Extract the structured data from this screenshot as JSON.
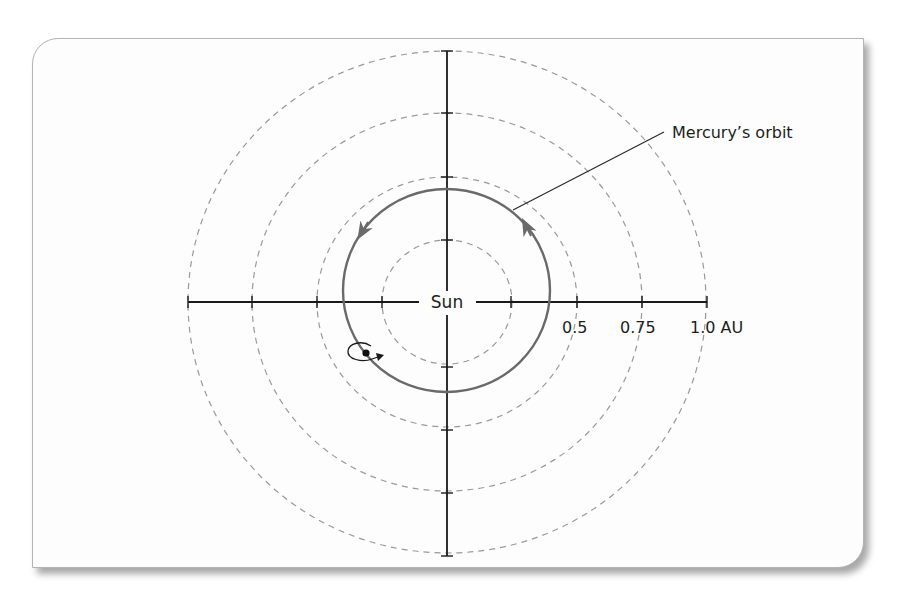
{
  "diagram": {
    "center_label": "Sun",
    "callout_label": "Mercury’s orbit",
    "axis_labels": [
      "0.5",
      "0.75",
      "1.0 AU"
    ],
    "rings_au": [
      0.25,
      0.5,
      0.75,
      1.0
    ],
    "planet": "Mercury",
    "colors": {
      "axis": "#1a1a1a",
      "orbit": "#6a6a6a",
      "rings": "#9a9a9a",
      "panel_border": "#b4b4b4",
      "background": "#fdfdfd"
    }
  }
}
